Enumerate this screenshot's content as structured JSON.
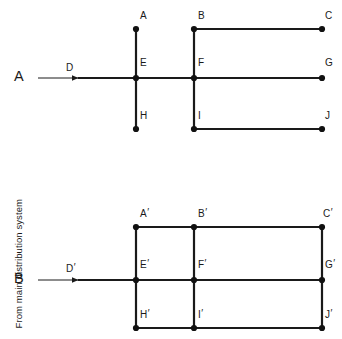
{
  "figure": {
    "background_color": "#ffffff",
    "line_color": "#1a1a1a",
    "node_color": "#111111",
    "side_label": "From main distribution system"
  },
  "systems": [
    {
      "id": "system-a",
      "name": "radial-distribution-system",
      "source_label": "A",
      "feeder_label": "D",
      "feeder_prime": "",
      "source": {
        "x": 22,
        "y": 78
      },
      "arrow": {
        "x1": 38,
        "y1": 78,
        "x2": 78,
        "y2": 78
      },
      "feeder_label_pos": {
        "x": 66,
        "y": 62
      },
      "feeder_line": {
        "x1": 78,
        "y1": 78,
        "x2": 136,
        "y2": 78
      },
      "columns_x": [
        136,
        194,
        322
      ],
      "rows_y": [
        29,
        78,
        129
      ],
      "nodes": [
        {
          "label": "A",
          "prime": "",
          "x": 136,
          "y": 29,
          "label_x": 140,
          "label_y": 10,
          "label_align": "above"
        },
        {
          "label": "B",
          "prime": "",
          "x": 194,
          "y": 29,
          "label_x": 198,
          "label_y": 10,
          "label_align": "above"
        },
        {
          "label": "C",
          "prime": "",
          "x": 322,
          "y": 29,
          "label_x": 325,
          "label_y": 10,
          "label_align": "above"
        },
        {
          "label": "E",
          "prime": "",
          "x": 136,
          "y": 78,
          "label_x": 140,
          "label_y": 57,
          "label_align": "inner"
        },
        {
          "label": "F",
          "prime": "",
          "x": 194,
          "y": 78,
          "label_x": 198,
          "label_y": 57,
          "label_align": "inner"
        },
        {
          "label": "G",
          "prime": "",
          "x": 322,
          "y": 78,
          "label_x": 325,
          "label_y": 57,
          "label_align": "inner"
        },
        {
          "label": "H",
          "prime": "",
          "x": 136,
          "y": 129,
          "label_x": 140,
          "label_y": 110,
          "label_align": "inner"
        },
        {
          "label": "I",
          "prime": "",
          "x": 194,
          "y": 129,
          "label_x": 198,
          "label_y": 110,
          "label_align": "inner"
        },
        {
          "label": "J",
          "prime": "",
          "x": 322,
          "y": 129,
          "label_x": 325,
          "label_y": 110,
          "label_align": "inner"
        }
      ],
      "segments": [
        {
          "from": "A",
          "to": "E",
          "x1": 136,
          "y1": 29,
          "x2": 136,
          "y2": 78
        },
        {
          "from": "E",
          "to": "H",
          "x1": 136,
          "y1": 78,
          "x2": 136,
          "y2": 129
        },
        {
          "from": "B",
          "to": "F",
          "x1": 194,
          "y1": 29,
          "x2": 194,
          "y2": 78
        },
        {
          "from": "F",
          "to": "I",
          "x1": 194,
          "y1": 78,
          "x2": 194,
          "y2": 129
        },
        {
          "from": "B",
          "to": "C",
          "x1": 194,
          "y1": 29,
          "x2": 322,
          "y2": 29
        },
        {
          "from": "E",
          "to": "G",
          "x1": 136,
          "y1": 78,
          "x2": 322,
          "y2": 78
        },
        {
          "from": "I",
          "to": "J",
          "x1": 194,
          "y1": 129,
          "x2": 322,
          "y2": 129
        }
      ]
    },
    {
      "id": "system-b",
      "name": "mesh-distribution-system",
      "source_label": "B",
      "feeder_label": "D",
      "feeder_prime": "′",
      "source": {
        "x": 22,
        "y": 280
      },
      "arrow": {
        "x1": 38,
        "y1": 280,
        "x2": 78,
        "y2": 280
      },
      "feeder_label_pos": {
        "x": 66,
        "y": 263
      },
      "feeder_line": {
        "x1": 78,
        "y1": 280,
        "x2": 136,
        "y2": 280
      },
      "columns_x": [
        136,
        194,
        322
      ],
      "rows_y": [
        227,
        280,
        328
      ],
      "nodes": [
        {
          "label": "A",
          "prime": "′",
          "x": 136,
          "y": 227,
          "label_x": 140,
          "label_y": 208,
          "label_align": "above"
        },
        {
          "label": "B",
          "prime": "′",
          "x": 194,
          "y": 227,
          "label_x": 198,
          "label_y": 208,
          "label_align": "above"
        },
        {
          "label": "C",
          "prime": "′",
          "x": 322,
          "y": 227,
          "label_x": 323,
          "label_y": 208,
          "label_align": "above"
        },
        {
          "label": "E",
          "prime": "′",
          "x": 136,
          "y": 280,
          "label_x": 140,
          "label_y": 259,
          "label_align": "inner"
        },
        {
          "label": "F",
          "prime": "′",
          "x": 194,
          "y": 280,
          "label_x": 198,
          "label_y": 259,
          "label_align": "inner"
        },
        {
          "label": "G",
          "prime": "′",
          "x": 322,
          "y": 280,
          "label_x": 325,
          "label_y": 259,
          "label_align": "inner"
        },
        {
          "label": "H",
          "prime": "′",
          "x": 136,
          "y": 328,
          "label_x": 140,
          "label_y": 309,
          "label_align": "inner"
        },
        {
          "label": "I",
          "prime": "′",
          "x": 194,
          "y": 328,
          "label_x": 198,
          "label_y": 309,
          "label_align": "inner"
        },
        {
          "label": "J",
          "prime": "′",
          "x": 322,
          "y": 328,
          "label_x": 325,
          "label_y": 309,
          "label_align": "inner"
        }
      ],
      "segments": [
        {
          "from": "A'",
          "to": "B'",
          "x1": 136,
          "y1": 227,
          "x2": 194,
          "y2": 227
        },
        {
          "from": "B'",
          "to": "C'",
          "x1": 194,
          "y1": 227,
          "x2": 322,
          "y2": 227
        },
        {
          "from": "E'",
          "to": "F'",
          "x1": 136,
          "y1": 280,
          "x2": 194,
          "y2": 280
        },
        {
          "from": "F'",
          "to": "G'",
          "x1": 194,
          "y1": 280,
          "x2": 322,
          "y2": 280
        },
        {
          "from": "H'",
          "to": "I'",
          "x1": 136,
          "y1": 328,
          "x2": 194,
          "y2": 328
        },
        {
          "from": "I'",
          "to": "J'",
          "x1": 194,
          "y1": 328,
          "x2": 322,
          "y2": 328
        },
        {
          "from": "A'",
          "to": "E'",
          "x1": 136,
          "y1": 227,
          "x2": 136,
          "y2": 280
        },
        {
          "from": "E'",
          "to": "H'",
          "x1": 136,
          "y1": 280,
          "x2": 136,
          "y2": 328
        },
        {
          "from": "B'",
          "to": "F'",
          "x1": 194,
          "y1": 227,
          "x2": 194,
          "y2": 280
        },
        {
          "from": "F'",
          "to": "I'",
          "x1": 194,
          "y1": 280,
          "x2": 194,
          "y2": 328
        },
        {
          "from": "C'",
          "to": "G'",
          "x1": 322,
          "y1": 227,
          "x2": 322,
          "y2": 280
        },
        {
          "from": "G'",
          "to": "J'",
          "x1": 322,
          "y1": 280,
          "x2": 322,
          "y2": 328
        }
      ]
    }
  ]
}
